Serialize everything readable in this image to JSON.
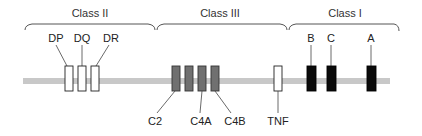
{
  "diagram": {
    "chromosome_color": "#c8c8c8",
    "classes": [
      {
        "label": "Class II"
      },
      {
        "label": "Class III"
      },
      {
        "label": "Class I"
      }
    ],
    "genes": [
      {
        "label": "DP",
        "class": "Class II",
        "style": "open",
        "label_side": "top"
      },
      {
        "label": "DQ",
        "class": "Class II",
        "style": "open",
        "label_side": "top"
      },
      {
        "label": "DR",
        "class": "Class II",
        "style": "open",
        "label_side": "top"
      },
      {
        "label": "C2",
        "class": "Class III",
        "style": "gray",
        "label_side": "bottom"
      },
      {
        "label": "",
        "class": "Class III",
        "style": "gray",
        "label_side": "none"
      },
      {
        "label": "C4A",
        "class": "Class III",
        "style": "gray",
        "label_side": "bottom"
      },
      {
        "label": "C4B",
        "class": "Class III",
        "style": "gray",
        "label_side": "bottom"
      },
      {
        "label": "TNF",
        "class": "Class III",
        "style": "open",
        "label_side": "bottom"
      },
      {
        "label": "B",
        "class": "Class I",
        "style": "black",
        "label_side": "top"
      },
      {
        "label": "C",
        "class": "Class I",
        "style": "black",
        "label_side": "top"
      },
      {
        "label": "A",
        "class": "Class I",
        "style": "black",
        "label_side": "top"
      }
    ],
    "styles": {
      "open": {
        "fill": "#ffffff",
        "stroke": "#222222"
      },
      "gray": {
        "fill": "#707070",
        "stroke": "#333333"
      },
      "black": {
        "fill": "#0a0a0a",
        "stroke": "#000000"
      }
    }
  }
}
